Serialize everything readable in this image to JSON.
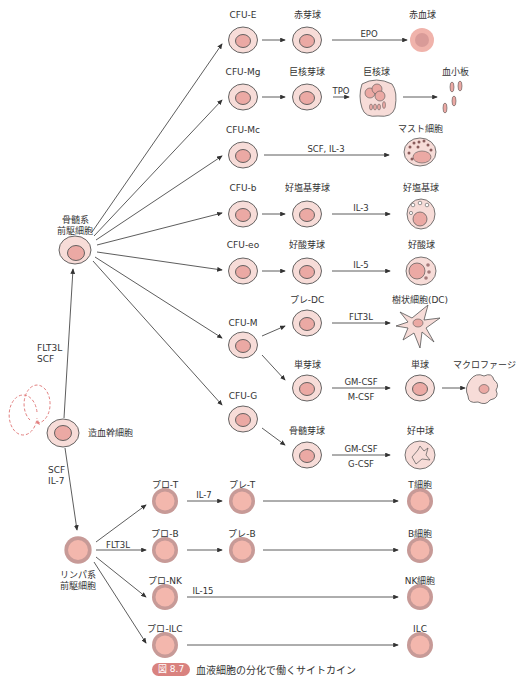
{
  "title": "血液細胞の分化で働くサイトカイン",
  "figure_badge": "図 8.7",
  "colors": {
    "cell_outer": "#f7dcd8",
    "cell_inner": "#eba9a4",
    "cell_stroke": "#555555",
    "lymph_outer": "#c79a97",
    "lymph_inner": "#f3b7ad",
    "badge": "#d9827f",
    "arrow": "#333333",
    "self_renew": "#e27f7f"
  },
  "stem": {
    "hsc": "造血幹細胞",
    "myeloid_progenitor": [
      "骨髄系",
      "前駆細胞"
    ],
    "lymphoid_progenitor": [
      "リンパ系",
      "前駆細胞"
    ],
    "hsc_to_myeloid_cytokines": [
      "FLT3L",
      "SCF"
    ],
    "hsc_to_lymphoid_cytokines": [
      "SCF",
      "IL-7"
    ]
  },
  "myeloid": {
    "cfu_e": {
      "label": "CFU-E",
      "precursor": "赤芽球",
      "cytokine": "EPO",
      "final": "赤血球"
    },
    "cfu_mg": {
      "label": "CFU-Mg",
      "precursor": "巨核芽球",
      "cytokine": "TPO",
      "intermediate": "巨核球",
      "final": "血小板"
    },
    "cfu_mc": {
      "label": "CFU-Mc",
      "cytokine": "SCF, IL-3",
      "final": "マスト細胞"
    },
    "cfu_b": {
      "label": "CFU-b",
      "precursor": "好塩基芽球",
      "cytokine": "IL-3",
      "final": "好塩基球"
    },
    "cfu_eo": {
      "label": "CFU-eo",
      "precursor": "好酸芽球",
      "cytokine": "IL-5",
      "final": "好酸球"
    },
    "cfu_m": {
      "label": "CFU-M",
      "pre_dc": "プレ-DC",
      "dc_cytokine": "FLT3L",
      "dc": "樹状細胞(DC)",
      "monoblast": "単芽球",
      "mono_cytokines": [
        "GM-CSF",
        "M-CSF"
      ],
      "monocyte": "単球",
      "macrophage": "マクロファージ"
    },
    "cfu_g": {
      "label": "CFU-G",
      "precursor": "骨髄芽球",
      "cytokines": [
        "GM-CSF",
        "G-CSF"
      ],
      "final": "好中球"
    }
  },
  "lymphoid": {
    "branch_cytokine": "FLT3L",
    "rows": [
      {
        "pro": "プロ-T",
        "cytokine": "IL-7",
        "pre": "プレ-T",
        "final": "T細胞"
      },
      {
        "pro": "プロ-B",
        "cytokine": "",
        "pre": "プレ-B",
        "final": "B細胞"
      },
      {
        "pro": "プロ-NK",
        "cytokine": "IL-15",
        "pre": "",
        "final": "NK細胞"
      },
      {
        "pro": "プロ-ILC",
        "cytokine": "",
        "pre": "",
        "final": "ILC"
      }
    ]
  }
}
